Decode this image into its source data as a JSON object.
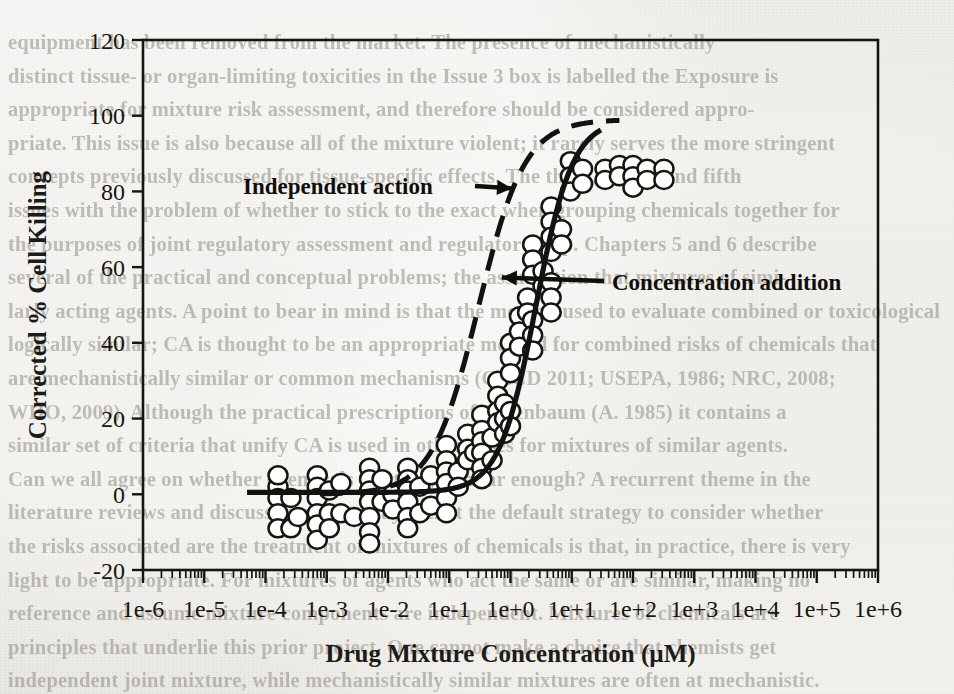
{
  "background_bleed_text": "equipment has been removed from the market. The presence of mechanistically\ndistinct tissue- or organ-limiting toxicities in the Issue 3 box is labelled the Exposure is\nappropriate for mixture risk assessment, and therefore should be considered appro-\npriate. This issue is also because all of the mixture violent; it rarely serves the more stringent\nconcepts previously discussed for tissue-specific effects. The third, fourth and fifth\nissues with the problem of whether to stick to the exact when grouping chemicals together for\nthe purposes of joint regulatory assessment and regulatory step. Chapters 5 and 6 describe\nseveral of the practical and conceptual problems; the assumption that mixtures of simi-\nlarly acting agents. A point to bear in mind is that the method used to evaluate combined or toxicological\nlogically similar; CA is thought to be an appropriate method for combined risks of chemicals that\nare mechanistically similar or common mechanisms (OECD 2011; USEPA, 1986; NRC, 2008;\nWHO, 2009). Although the practical prescriptions of Berenbaum (A. 1985) it contains a\nsimilar set of criteria that unify CA is used in other cases for mixtures of similar agents.\nCan we all agree on whether chemicals are truly similar enough? A recurrent theme in the\nliterature reviews and discussions still today is that the default strategy to consider whether\nthe risks associated are the treatment of mixtures of chemicals is that, in practice, there is very\nlight to be appropriate. For mixtures of agents who act the same or are similar, making no\nreference and assume mixture components are independent. Mixtures of chemicals are\nprinciples that underlie this prior project. One cannot make a choice that chemists get\nindependent joint mixture, while mechanistically similar mixtures are often at mechanistic.\nRegardless of this, effect-related approach across the argument, every interaction risk\nassessment for this case. We can see that also depends on the mixture components as well.",
  "chart_data": {
    "type": "scatter",
    "title": "",
    "xlabel": "Drug Mixture Concentration (µM)",
    "ylabel": "Corrected % Cell Killing",
    "xscale": "log",
    "xlim": [
      1e-06,
      1000000.0
    ],
    "ylim": [
      -20,
      120
    ],
    "yticks": [
      -20,
      0,
      20,
      40,
      60,
      80,
      100,
      120
    ],
    "xticks": [
      "1e-6",
      "1e-5",
      "1e-4",
      "1e-3",
      "1e-2",
      "1e-1",
      "1e+0",
      "1e+1",
      "1e+2",
      "1e+3",
      "1e+4",
      "1e+5",
      "1e+6"
    ],
    "grid": false,
    "legend_position": "inline-annotations",
    "annotations": [
      {
        "name": "independent-action",
        "label": "Independent action",
        "points_to_x": 1.1,
        "points_to_y": 80
      },
      {
        "name": "concentration-addition",
        "label": "Concentration addition",
        "points_to_x": 0.62,
        "points_to_y": 57
      }
    ],
    "series": [
      {
        "name": "Independent action",
        "type": "line",
        "style": "dashed",
        "color": "#141210",
        "model": "sigmoid",
        "ec50": 0.3,
        "hill": 1.15,
        "top": 99,
        "bottom": 0,
        "x_start": 0.0008,
        "x_end": 60
      },
      {
        "name": "Concentration addition",
        "type": "line",
        "style": "solid",
        "color": "#141210",
        "model": "sigmoid",
        "ec50": 2.6,
        "hill": 1.45,
        "top": 99,
        "bottom": 0.5,
        "x_start": 5e-05,
        "x_end": 30
      },
      {
        "name": "Observed data",
        "type": "scatter",
        "marker": "open-circle",
        "marker_color": "#ffffff",
        "marker_edge_color": "#17150f",
        "points": [
          [
            0.00016,
            2
          ],
          [
            0.00016,
            -1
          ],
          [
            0.00016,
            -5
          ],
          [
            0.00016,
            -9
          ],
          [
            0.00016,
            5
          ],
          [
            0.00026,
            -1
          ],
          [
            0.00026,
            -9
          ],
          [
            0.00034,
            -6
          ],
          [
            0.0007,
            5
          ],
          [
            0.0007,
            2
          ],
          [
            0.0007,
            -1
          ],
          [
            0.0007,
            -5
          ],
          [
            0.0007,
            -8
          ],
          [
            0.0007,
            -12
          ],
          [
            0.0011,
            1
          ],
          [
            0.0011,
            -5
          ],
          [
            0.0011,
            -9
          ],
          [
            0.0017,
            3
          ],
          [
            0.0017,
            -5
          ],
          [
            0.0028,
            -6
          ],
          [
            0.005,
            7
          ],
          [
            0.005,
            4
          ],
          [
            0.005,
            1
          ],
          [
            0.005,
            -2
          ],
          [
            0.005,
            -6
          ],
          [
            0.005,
            -10
          ],
          [
            0.005,
            -13
          ],
          [
            0.008,
            4
          ],
          [
            0.008,
            -2
          ],
          [
            0.012,
            0
          ],
          [
            0.012,
            -4
          ],
          [
            0.021,
            7
          ],
          [
            0.021,
            4
          ],
          [
            0.021,
            1
          ],
          [
            0.021,
            -2
          ],
          [
            0.021,
            -6
          ],
          [
            0.021,
            -9
          ],
          [
            0.033,
            2
          ],
          [
            0.033,
            -5
          ],
          [
            0.05,
            5
          ],
          [
            0.05,
            -3
          ],
          [
            0.09,
            13
          ],
          [
            0.09,
            9
          ],
          [
            0.09,
            6
          ],
          [
            0.09,
            3
          ],
          [
            0.09,
            -1
          ],
          [
            0.09,
            -5
          ],
          [
            0.14,
            6
          ],
          [
            0.14,
            2
          ],
          [
            0.2,
            16
          ],
          [
            0.2,
            12
          ],
          [
            0.2,
            9
          ],
          [
            0.26,
            11
          ],
          [
            0.34,
            21
          ],
          [
            0.34,
            17
          ],
          [
            0.34,
            14
          ],
          [
            0.34,
            11
          ],
          [
            0.34,
            7
          ],
          [
            0.34,
            4
          ],
          [
            0.5,
            15
          ],
          [
            0.5,
            9
          ],
          [
            0.62,
            30
          ],
          [
            0.62,
            26
          ],
          [
            0.62,
            22
          ],
          [
            0.62,
            19
          ],
          [
            0.8,
            24
          ],
          [
            0.8,
            20
          ],
          [
            0.8,
            16
          ],
          [
            1.0,
            40
          ],
          [
            1.0,
            36
          ],
          [
            1.0,
            32
          ],
          [
            1.0,
            22
          ],
          [
            1.0,
            18
          ],
          [
            1.4,
            47
          ],
          [
            1.4,
            43
          ],
          [
            1.4,
            39
          ],
          [
            1.9,
            52
          ],
          [
            1.9,
            48
          ],
          [
            2.3,
            66
          ],
          [
            2.3,
            62
          ],
          [
            2.3,
            58
          ],
          [
            2.3,
            46
          ],
          [
            2.3,
            42
          ],
          [
            2.3,
            38
          ],
          [
            3.4,
            59
          ],
          [
            3.4,
            55
          ],
          [
            4.6,
            76
          ],
          [
            4.6,
            72
          ],
          [
            4.6,
            68
          ],
          [
            4.6,
            64
          ],
          [
            4.6,
            56
          ],
          [
            4.6,
            52
          ],
          [
            4.6,
            48
          ],
          [
            6.8,
            70
          ],
          [
            6.8,
            66
          ],
          [
            9.5,
            88
          ],
          [
            9.5,
            84
          ],
          [
            9.5,
            80
          ],
          [
            15.0,
            86
          ],
          [
            15.0,
            82
          ],
          [
            35.0,
            86
          ],
          [
            35.0,
            83
          ],
          [
            60.0,
            87
          ],
          [
            60.0,
            84
          ],
          [
            100.0,
            87
          ],
          [
            100.0,
            84
          ],
          [
            100.0,
            81
          ],
          [
            170.0,
            86
          ],
          [
            170.0,
            83
          ],
          [
            320.0,
            86
          ],
          [
            320.0,
            83
          ]
        ]
      }
    ]
  }
}
